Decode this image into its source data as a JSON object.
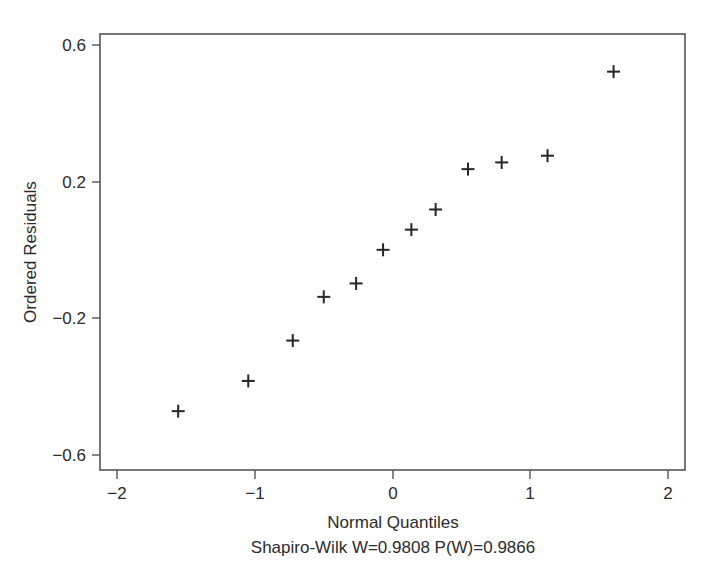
{
  "figure": {
    "background_color": "#ffffff",
    "frame_color": "#555555",
    "marker_color": "#262626",
    "marker_symbol": "plus"
  },
  "chart_data": {
    "type": "scatter",
    "title": "",
    "subtitle": "",
    "xlabel": "Normal Quantiles",
    "ylabel": "Ordered Residuals",
    "caption": "Shapiro-Wilk W=0.9808 P(W)=0.9866",
    "xlim": [
      -2.22,
      2.12
    ],
    "ylim": [
      -0.665,
      0.632
    ],
    "xticks": [
      -2,
      -1,
      0,
      1,
      2
    ],
    "xtick_labels": [
      "−2",
      "−1",
      "0",
      "1",
      "2"
    ],
    "yticks": [
      -0.6,
      -0.2,
      0.2,
      0.6
    ],
    "ytick_labels": [
      "−0.6",
      "−0.2",
      "0.2",
      "0.6"
    ],
    "grid": false,
    "legend": false,
    "legend_position": "none",
    "series": [
      {
        "name": "Ordered Residuals",
        "marker": "plus",
        "x": [
          -1.64,
          -1.12,
          -0.79,
          -0.56,
          -0.32,
          -0.12,
          0.09,
          0.27,
          0.51,
          0.76,
          1.1,
          1.59
        ],
        "y": [
          -0.49,
          -0.4,
          -0.28,
          -0.15,
          -0.11,
          -0.01,
          0.05,
          0.11,
          0.23,
          0.25,
          0.27,
          0.52
        ]
      }
    ],
    "statistics": {
      "test_name": "Shapiro-Wilk",
      "W_label": "W",
      "W_value": "0.9808",
      "P_label": "P(W)",
      "P_value": "0.9866"
    },
    "n_points": 12
  }
}
